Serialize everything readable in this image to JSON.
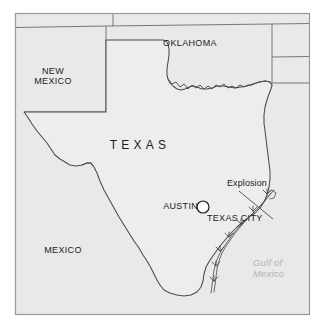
{
  "figure": {
    "kind": "reference-map",
    "width": 325,
    "height": 333,
    "frame": {
      "x": 15,
      "y": 13,
      "width": 295,
      "height": 302
    }
  },
  "colors": {
    "page_background": "#ffffff",
    "land_fill": "#e9e9e9",
    "texas_fill": "#ececec",
    "neighbor_fill": "#e6e6e6",
    "border_line": "#6b6b6b",
    "coast_line": "#555555",
    "state_outline": "#4a4a4a",
    "frame_line": "#9a9a9a",
    "label_text": "#1c1c1c",
    "water_text": "#b3b3b3",
    "city_dot_fill": "#ffffff",
    "city_dot_stroke": "#1c1c1c",
    "leader_line": "#4a4a4a"
  },
  "labels": {
    "states": [
      {
        "name": "new-mexico",
        "text": "NEW\nMEXICO",
        "x": 42,
        "y": 73
      },
      {
        "name": "oklahoma",
        "text": "OKLAHOMA",
        "x": 183,
        "y": 44
      },
      {
        "name": "texas",
        "text": "TEXAS",
        "x": 136,
        "y": 146
      },
      {
        "name": "mexico",
        "text": "MEXICO",
        "x": 60,
        "y": 251
      }
    ],
    "cities": [
      {
        "name": "austin",
        "text": "AUSTIN",
        "x": 156,
        "y": 203
      },
      {
        "name": "texas-city",
        "text": "TEXAS CITY",
        "x": 208,
        "y": 216
      }
    ],
    "callouts": [
      {
        "name": "explosion",
        "text": "Explosion",
        "x": 226,
        "y": 181
      }
    ],
    "water": [
      {
        "name": "gulf-of-mexico",
        "text": "Gulf of\nMexico",
        "x": 255,
        "y": 262
      }
    ]
  },
  "markers": {
    "austin_dot": {
      "cx": 203,
      "cy": 207,
      "r": 6
    }
  },
  "leader": {
    "from": {
      "x": 239,
      "y": 191
    },
    "to": {
      "x": 273,
      "y": 219
    }
  },
  "geometry": {
    "texas_outline": "M 108,40 L 108,112 L 24,112 L 26,114 L 31,123 L 36,130 L 41,136 L 46,141 L 50,147 L 53,153 L 58,158 L 62,161 L 66,166 L 72,168 L 78,167 L 83,165 L 88,164 L 93,168 L 96,175 L 99,183 L 103,192 L 108,201 L 113,210 L 118,219 L 124,228 L 129,236 L 134,244 L 139,252 L 144,259 L 148,265 L 152,271 L 155,277 L 158,283 L 161,288 L 166,292 L 172,294 L 179,296 L 186,297 L 193,296 L 199,293 L 203,288 L 205,282 L 206,275 L 208,268 L 212,261 L 217,254 L 222,248 L 227,241 L 232,235 L 238,229 L 244,224 L 250,220 L 256,216 L 261,211 L 265,205 L 268,198 L 270,190 L 271,182 L 271,174 L 270,166 L 269,158 L 268,150 L 267,142 L 266,134 L 265,126 L 265,118 L 266,110 L 268,103 L 270,97 L 272,92 L 273,87 L 272,83 L 268,81 L 262,81 L 256,83 L 250,85 L 244,87 L 238,88 L 232,88 L 226,87 L 220,86 L 215,87 L 210,89 L 205,90 L 200,89 L 196,87 L 192,86 L 188,87 L 184,89 L 180,90 L 176,89 L 172,86 L 169,83 L 167,80 L 166,76 L 166,70 L 167,64 L 168,57 L 168,51 L 167,46 L 165,42 L 162,40 Z",
    "rio_grande_notch": "M 88,164 L 92,167 L 95,173",
    "panhandle_top": "M 108,40 L 162,40",
    "new_mexico_east": "M 24,112 L 24,29",
    "new_mexico_north": "M 24,29 L 108,27",
    "oklahoma_north": "M 108,27 L 271,25",
    "kansas_divider": "M 113,13 L 113,27",
    "arkansas_west": "M 272,25 L 272,83",
    "arkansas_louisiana": "M 272,58 L 310,58",
    "oklahoma_kansas_top": "M 271,25 L 310,25",
    "louisiana_east": "M 272,83 L 310,83",
    "coastline": "M 268,198 L 262,204 L 256,210 L 250,215 L 244,220 L 238,226 L 232,232 L 227,238 L 222,245 L 217,251 L 212,258 L 208,265 L 206,272 L 205,279 L 204,286 L 202,292",
    "barrier_islands": "M 271,192 L 266,199 L 260,206 L 254,212 L 248,218 L 242,224 L 236,230 L 230,237 L 225,244 L 220,251 L 216,258 L 213,265 L 211,273 L 210,281 L 209,289",
    "marsh_marks": [
      {
        "x": 268,
        "y": 196
      },
      {
        "x": 255,
        "y": 210
      },
      {
        "x": 242,
        "y": 223
      },
      {
        "x": 230,
        "y": 236
      },
      {
        "x": 220,
        "y": 250
      },
      {
        "x": 213,
        "y": 265
      }
    ]
  }
}
